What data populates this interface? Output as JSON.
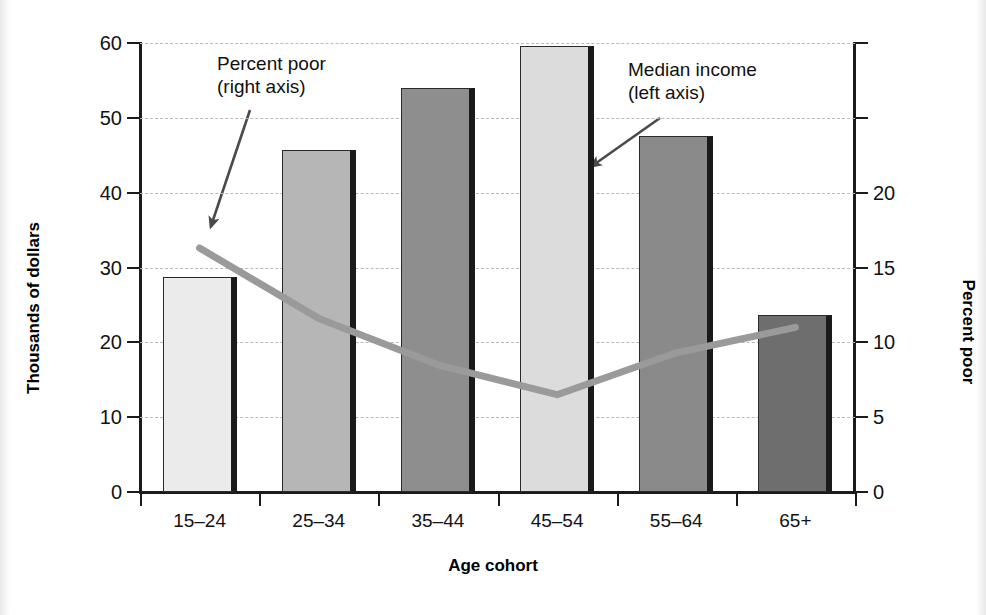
{
  "chart_data": {
    "type": "bar",
    "title": "",
    "xlabel": "Age cohort",
    "ylabel": "Thousands of dollars",
    "ylabel_right": "Percent poor",
    "categories": [
      "15–24",
      "25–34",
      "35–44",
      "45–54",
      "55–64",
      "65+"
    ],
    "ylim": [
      0,
      60
    ],
    "ylim_right": [
      0,
      30
    ],
    "yticks": [
      0,
      10,
      20,
      30,
      40,
      50,
      60
    ],
    "ytick_labels": [
      "0",
      "10",
      "20",
      "30",
      "40",
      "50",
      "60"
    ],
    "yticks_right": [
      0,
      5,
      10,
      15,
      20,
      25,
      30
    ],
    "ytick_labels_right": [
      "0",
      "5",
      "10",
      "15",
      "20",
      "",
      ""
    ],
    "grid": true,
    "grid_style": "dashed",
    "legend_position": "annotations",
    "series": [
      {
        "name": "Median income (left axis)",
        "type": "bar",
        "axis": "left",
        "unit": "thousands of dollars",
        "values": [
          28.7,
          45.7,
          54.0,
          59.6,
          47.6,
          23.7
        ],
        "colors": [
          "#ebebeb",
          "#b6b6b6",
          "#8e8e8e",
          "#dcdcdc",
          "#8a8a8a",
          "#6e6e6e"
        ]
      },
      {
        "name": "Percent poor (right axis)",
        "type": "line",
        "axis": "right",
        "unit": "percent",
        "values": [
          16.3,
          11.6,
          8.5,
          6.5,
          9.3,
          11.0
        ],
        "color": "#9a9a9a"
      }
    ],
    "annotations": [
      {
        "id": "percent-poor",
        "line1": "Percent poor",
        "line2": "(right axis)",
        "points_to": "line-series"
      },
      {
        "id": "median-income",
        "line1": "Median income",
        "line2": "(left axis)",
        "points_to": "bar-series"
      }
    ]
  },
  "axes": {
    "left": {
      "title": "Thousands of dollars",
      "ticks": [
        "0",
        "10",
        "20",
        "30",
        "40",
        "50",
        "60"
      ]
    },
    "right": {
      "title": "Percent poor",
      "ticks": [
        "0",
        "5",
        "10",
        "15",
        "20",
        "",
        ""
      ]
    },
    "bottom": {
      "title": "Age cohort",
      "ticks": [
        "15–24",
        "25–34",
        "35–44",
        "45–54",
        "55–64",
        "65+"
      ]
    }
  },
  "annotations": {
    "percent_poor": {
      "line1": "Percent poor",
      "line2": "(right axis)"
    },
    "median_income": {
      "line1": "Median income",
      "line2": "(left axis)"
    }
  },
  "colors": {
    "axis": "#1b1b1b",
    "grid": "#b9b9b9",
    "line_series": "#9a9a9a",
    "text": "#101010",
    "background": "#ffffff"
  }
}
